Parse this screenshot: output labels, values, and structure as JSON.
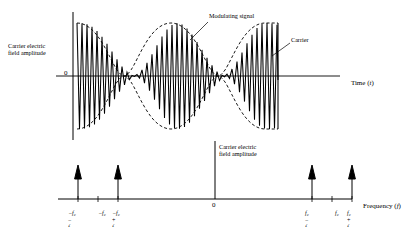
{
  "figure": {
    "title_none": "",
    "time_plot": {
      "y_axis_label": "Carrier electric\nfield amplitude",
      "y_zero_label": "0",
      "x_axis_label": "Time (t)",
      "x_axis_label_text": "Time",
      "x_axis_label_var": "t",
      "annotations": [
        {
          "text": "Modulating signal",
          "name": "modulating-signal"
        },
        {
          "text": "Carrier",
          "name": "carrier"
        }
      ]
    },
    "spectrum_plot": {
      "y_axis_label": "Carrier electric\nfield amplitude",
      "x_axis_label_text": "Frequency",
      "x_axis_label_var": "f",
      "center_label": "0",
      "tick_labels": [
        {
          "id": "neg-fc-minus-fm",
          "base": "f",
          "sub": "c",
          "prefix": "-",
          "op": " - ",
          "base2": "f",
          "sub2": "m"
        },
        {
          "id": "neg-fc",
          "base": "f",
          "sub": "c",
          "prefix": "-",
          "op": "",
          "base2": "",
          "sub2": ""
        },
        {
          "id": "neg-fc-plus-fm",
          "base": "f",
          "sub": "c",
          "prefix": "-",
          "op": " + ",
          "base2": "f",
          "sub2": "m"
        },
        {
          "id": "pos-fc-minus-fm",
          "base": "f",
          "sub": "c",
          "prefix": "",
          "op": " - ",
          "base2": "f",
          "sub2": "m"
        },
        {
          "id": "pos-fc",
          "base": "f",
          "sub": "c",
          "prefix": "",
          "op": "",
          "base2": "",
          "sub2": ""
        },
        {
          "id": "pos-fc-plus-fm",
          "base": "f",
          "sub": "c",
          "prefix": "",
          "op": " + ",
          "base2": "f",
          "sub2": "m"
        }
      ]
    }
  },
  "chart_data": {
    "type": "line",
    "panels": [
      {
        "name": "time-domain",
        "type": "line",
        "xlabel": "Time (t)",
        "ylabel": "Carrier electric field amplitude",
        "xlim": [
          0,
          1
        ],
        "ylim": [
          -1.15,
          1.15
        ],
        "grid": false,
        "series": [
          {
            "name": "modulated carrier",
            "description": "Fully modulated AM carrier, carrier frequency fc with sinusoidal envelope at fm",
            "carrier_cycles": 40,
            "envelope_cycles": 2,
            "modulation_index": 1.0,
            "amplitude": 1.0
          },
          {
            "name": "modulating signal envelope",
            "description": "Dashed upper and lower envelope |cos|",
            "style": "dashed",
            "envelope_cycles": 2
          }
        ],
        "annotations": [
          {
            "label": "Modulating signal",
            "points_to": "upper envelope"
          },
          {
            "label": "Carrier",
            "points_to": "carrier oscillation near right end"
          }
        ]
      },
      {
        "name": "frequency-domain",
        "type": "bar",
        "xlabel": "Frequency (f)",
        "ylabel": "Carrier electric field amplitude",
        "grid": false,
        "categories": [
          "-fc - fm",
          "-fc",
          "-fc + fm",
          "0",
          "fc - fm",
          "fc",
          "fc + fm"
        ],
        "values": [
          0.5,
          0,
          0.5,
          0,
          0.5,
          0,
          0.5
        ],
        "notes": "Spectral lines (arrows) at the two sidebands on each side; carrier positions -fc and fc shown as ticks only"
      }
    ],
    "colors": {
      "ink": "#000000",
      "background": "#ffffff"
    }
  }
}
